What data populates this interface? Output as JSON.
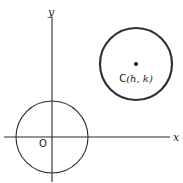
{
  "diagram": {
    "axes": {
      "x_label": "x",
      "y_label": "y"
    },
    "origin_circle": {
      "label": "O",
      "center": [
        0,
        0
      ]
    },
    "translated_circle": {
      "center_label": "C(h, k)",
      "center_name": "C",
      "center_coords": "(h, k)"
    }
  }
}
